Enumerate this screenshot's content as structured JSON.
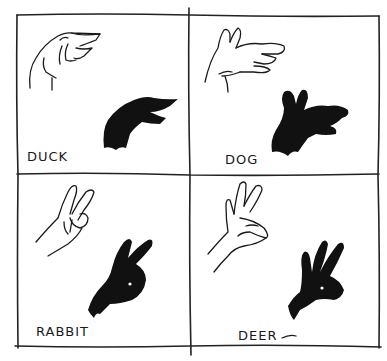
{
  "figure": {
    "panels": [
      {
        "id": "duck",
        "label": "DUCK"
      },
      {
        "id": "dog",
        "label": "DOG"
      },
      {
        "id": "rabbit",
        "label": "RABBIT"
      },
      {
        "id": "deer",
        "label": "DEER"
      }
    ]
  },
  "colors": {
    "ink": "#1a1a1a",
    "shadow": "#111111",
    "paper": "#ffffff"
  }
}
